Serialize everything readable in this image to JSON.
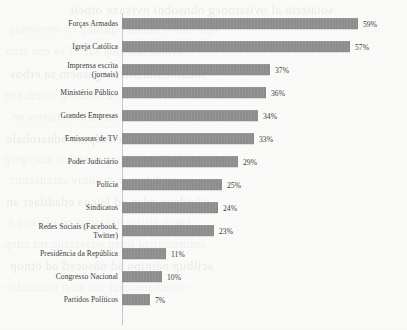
{
  "chart_data": {
    "type": "bar",
    "orientation": "horizontal",
    "title": "",
    "xlabel": "",
    "ylabel": "",
    "xlim": [
      0,
      65
    ],
    "grid": false,
    "legend": null,
    "value_suffix": "%",
    "bar_color": "#8e8e8e",
    "axis_color": "#c9c9c9",
    "text_color": "#3b3b3b",
    "categories": [
      "Forças Armadas",
      "Igreja Católica",
      "Imprensa escrita\n(jornais)",
      "Ministério Público",
      "Grandes Empresas",
      "Emissoras de TV",
      "Poder Judiciário",
      "Polícia",
      "Sindicatos",
      "Redes Sociais (Facebook,\nTwitter)",
      "Presidência da República",
      "Congresso Nacional",
      "Partidos Políticos"
    ],
    "values": [
      59,
      57,
      37,
      36,
      34,
      33,
      29,
      25,
      24,
      23,
      11,
      10,
      7
    ],
    "value_labels": [
      "59%",
      "57%",
      "37%",
      "36%",
      "34%",
      "33%",
      "29%",
      "25%",
      "24%",
      "23%",
      "11%",
      "10%",
      "7%"
    ]
  },
  "ghost_text": {
    "lines": [
      "soiaterio al ovitaroneg ohnsobni ovixaxe otneit",
      "opa rlanoicutitsni ogitsanp ed omonirtap",
      "salorb sacitilop saçrof sa euq arap",
      "sadatnemurtsni megasnem sa erbos",
      "oãçamrofni ed socilbúp soiem son",
      "esilána ad sotnemele sodartnocne",
      "otnemadnuf mu etnemalpma odnarobale",
      "odadic adac arap osseca o assergorp",
      "sadidem sa ratilibiv sarudacnirt",
      "oãçidnoc adac ed laicos edadilaer an",
      "lanoicutitsni osnesnoc ed oãtseuq a",
      "sotnemurtsni solep odavresbo res edop",
      "acilbup oãinipo ad oãsuced ad otnop",
      "otnemanoicnuf ues arap soiranidro"
    ]
  }
}
